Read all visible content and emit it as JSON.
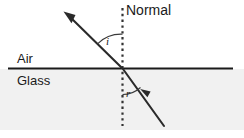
{
  "diagram": {
    "canvas": {
      "width": 244,
      "height": 138,
      "background": "#ffffff"
    },
    "labels": {
      "normal": "Normal",
      "air": "Air",
      "glass": "Glass",
      "angle_of_incidence": "i",
      "angle_of_refraction": "r"
    },
    "colors": {
      "ink": "#1a1a1a",
      "interface_line": "#1a1a1a",
      "glass_fill": "#f1f1f1",
      "ray": "#2a2a2a",
      "normal_dotted": "#3a3a3a"
    },
    "geometry": {
      "interface_y": 68,
      "interface_x_start": 8,
      "interface_x_end": 233,
      "normal_x": 122,
      "normal_y_top": 8,
      "normal_y_bottom": 126,
      "incidence_point": {
        "x": 122,
        "y": 68
      },
      "emergent_ray_tip": {
        "x": 64,
        "y": 12
      },
      "incident_ray_start": {
        "x": 164,
        "y": 126
      },
      "refracted_arrow_tip": {
        "x": 141,
        "y": 89
      },
      "glass_region_bottom": 130
    },
    "media": {
      "upper": "Air",
      "lower": "Glass"
    }
  }
}
